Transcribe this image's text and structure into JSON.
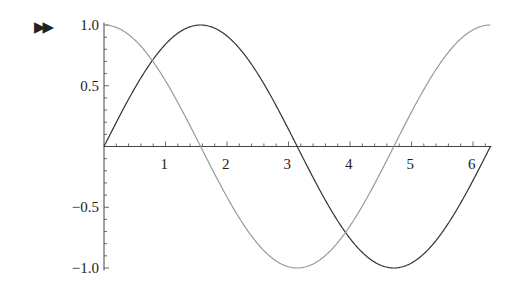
{
  "marker": {
    "glyph": "▶▶",
    "icon": "output-marker-icon"
  },
  "chart_data": {
    "type": "line",
    "title": "",
    "xlabel": "",
    "ylabel": "",
    "xlim": [
      0,
      6.2832
    ],
    "ylim": [
      -1.0,
      1.0
    ],
    "grid": false,
    "legend": null,
    "x_ticks": [
      "1",
      "2",
      "3",
      "4",
      "5",
      "6"
    ],
    "y_ticks": [
      "1.0",
      "0.5",
      "-0.5",
      "-1.0"
    ],
    "series": [
      {
        "name": "sin(x)",
        "function": "sin",
        "color": "#333333",
        "sample": {
          "x": [
            0,
            1.5708,
            3.1416,
            4.7124,
            6.2832
          ],
          "y": [
            0,
            1,
            0,
            -1,
            0
          ]
        }
      },
      {
        "name": "cos(x)",
        "function": "cos",
        "color": "#9a9a9a",
        "sample": {
          "x": [
            0,
            1.5708,
            3.1416,
            4.7124,
            6.2832
          ],
          "y": [
            1,
            0,
            -1,
            0,
            1
          ]
        }
      }
    ]
  },
  "colors": {
    "axis": "#444444",
    "text": "#222222"
  }
}
